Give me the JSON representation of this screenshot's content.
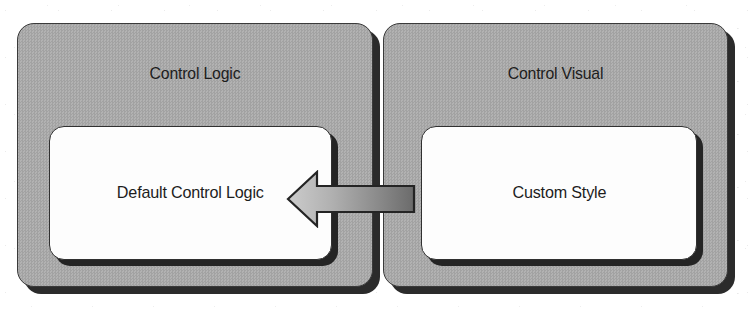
{
  "diagram": {
    "type": "block-diagram",
    "background_color": "#ffffff",
    "panel_fill_color": "#a9a9a9",
    "panel_border_color": "#3a3a3a",
    "panel_shadow_color": "#2b2b2b",
    "inner_box_fill_color": "#fdfdfd",
    "inner_box_border_color": "#303030",
    "inner_box_shadow_color": "#242424",
    "arrow_fill_start_color": "#c9c9c9",
    "arrow_fill_end_color": "#6f6f6f",
    "arrow_border_color": "#2a2a2a",
    "text_color": "#1d1d1d"
  },
  "panels": [
    {
      "id": "control-logic",
      "title": "Control Logic",
      "inner": {
        "id": "default-control-logic",
        "label": "Default Control Logic"
      }
    },
    {
      "id": "control-visual",
      "title": "Control Visual",
      "inner": {
        "id": "custom-style",
        "label": "Custom Style"
      }
    }
  ],
  "connector": {
    "name": "arrow-left",
    "direction": "left",
    "from": "custom-style",
    "to": "default-control-logic",
    "label": ""
  }
}
